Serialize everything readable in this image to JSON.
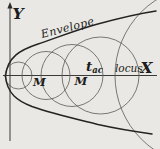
{
  "figure": {
    "labels": {
      "y_axis": "Y",
      "x_axis": "X",
      "envelope": "Envelope",
      "t_main": "t",
      "t_sub": "ac",
      "locus": "locus",
      "m_left": "M",
      "m_right": "M"
    },
    "colors": {
      "background": "#e9e8e4",
      "envelope_stroke": "#232321",
      "circle_stroke": "#5b5b58",
      "axis_stroke": "#3a3a38",
      "text": "#1c1c1a"
    },
    "diagram": {
      "x_axis": {
        "x1": 3,
        "y1": 75.5,
        "x2": 157,
        "y2": 75.5
      },
      "y_axis": {
        "x1": 10,
        "y1": 141,
        "x2": 10,
        "y2": 5
      },
      "y_arrow_points": "10,2 7.4,8.5 12.6,8.5",
      "circles": [
        {
          "cx": 18.5,
          "cy": 75.5,
          "r": 13.5
        },
        {
          "cx": 46,
          "cy": 75.5,
          "r": 24
        },
        {
          "cx": 72,
          "cy": 75.5,
          "r": 31
        },
        {
          "cx": 100.5,
          "cy": 75.5,
          "r": 38.5
        },
        {
          "cx": 205,
          "cy": 75.5,
          "r": 90
        }
      ],
      "envelope_top_path": "M156,11 C136,14 116,19 96,24.5 C76,30 56,38 38,44 C20,50 7.5,57 5.5,76",
      "envelope_bottom_path": "M5.5,76 C7,94 18,101 32,106.5 C52,113.5 76,119 98,124.5 C118,129 138,132 152,134"
    }
  }
}
